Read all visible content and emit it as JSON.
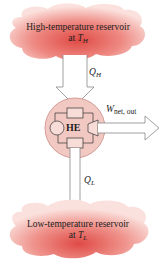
{
  "diagram": {
    "type": "heat-engine-schematic",
    "high_reservoir": {
      "line1": "High-temperature reservoir",
      "line2_prefix": "at ",
      "temp_symbol": "T",
      "temp_sub": "H"
    },
    "heat_in": {
      "symbol": "Q",
      "sub": "H"
    },
    "engine": {
      "label": "HE"
    },
    "work_out": {
      "symbol": "W",
      "sub": "net, out"
    },
    "heat_out": {
      "symbol": "Q",
      "sub": "L"
    },
    "low_reservoir": {
      "line1": "Low-temperature reservoir",
      "line2_prefix": "at ",
      "temp_symbol": "T",
      "temp_sub": "L"
    },
    "colors": {
      "cloud_center": "#e0554f",
      "cloud_edge": "#f7d6d2",
      "engine_fill": "#f2c8c2",
      "engine_stroke": "#c98b85",
      "arrow_stroke": "#888888",
      "text": "#222222"
    }
  }
}
